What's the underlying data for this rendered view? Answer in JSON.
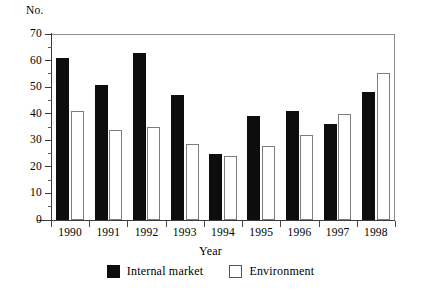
{
  "chart_data": {
    "type": "bar",
    "title": "",
    "xlabel": "Year",
    "ylabel": "No.",
    "categories": [
      "1990",
      "1991",
      "1992",
      "1993",
      "1994",
      "1995",
      "1996",
      "1997",
      "1998"
    ],
    "series": [
      {
        "name": "Internal market",
        "color": "#0d0d0d",
        "style": "filled",
        "values": [
          61,
          51,
          63,
          47,
          25,
          39,
          41,
          36,
          48
        ]
      },
      {
        "name": "Environment",
        "color": "#ffffff",
        "style": "outlined",
        "values": [
          41,
          34,
          35,
          28.5,
          24,
          28,
          32,
          40,
          55.5
        ]
      }
    ],
    "ylim": [
      0,
      70
    ],
    "yticks": [
      0,
      10,
      20,
      30,
      40,
      50,
      60,
      70
    ],
    "ytick_labels": [
      "0",
      "10",
      "20",
      "30",
      "40",
      "50",
      "60",
      "70"
    ],
    "y_minor_ticks": [
      5,
      15,
      25,
      35,
      45,
      55,
      65
    ],
    "grid": false,
    "legend_position": "bottom-center",
    "frame": "top-right-box"
  },
  "axes": {
    "y_title": "No.",
    "x_title": "Year"
  },
  "legend": {
    "entries": [
      {
        "label": "Internal market",
        "swatch": "filled-black-square"
      },
      {
        "label": "Environment",
        "swatch": "outlined-white-square"
      }
    ]
  }
}
